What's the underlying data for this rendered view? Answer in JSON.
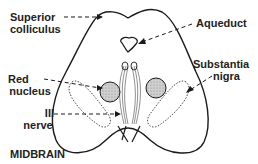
{
  "diagram": {
    "title": "MIDBRAIN",
    "labels": {
      "superior_colliculus_line1": "Superior",
      "superior_colliculus_line2": "colliculus",
      "aqueduct": "Aqueduct",
      "substantia_nigra_line1": "Substantia",
      "substantia_nigra_line2": "nigra",
      "red_nucleus_line1": "Red",
      "red_nucleus_line2": "nucleus",
      "third_nerve_line1": "III",
      "third_nerve_line2": "nerve"
    },
    "colors": {
      "outline": "#1a1a1a",
      "text": "#222222",
      "red_nucleus_fill": "#bdbdbd",
      "background": "#ffffff"
    }
  }
}
